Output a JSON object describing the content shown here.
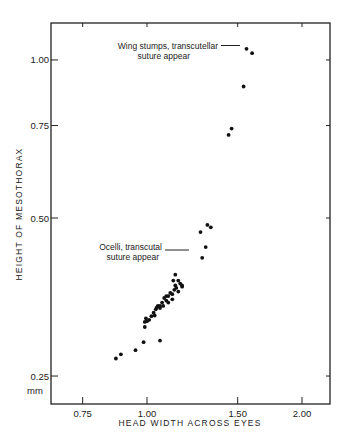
{
  "chart_data": {
    "type": "scatter",
    "title": "",
    "xlabel": "HEAD WIDTH ACROSS EYES",
    "ylabel": "HEIGHT OF MESOTHORAX",
    "x_scale": "log",
    "y_scale": "log",
    "xlim": [
      0.66,
      2.2
    ],
    "ylim": [
      0.235,
      1.15
    ],
    "x_ticks": [
      {
        "value": 0.75,
        "label": "0.75"
      },
      {
        "value": 1.0,
        "label": "1.00"
      },
      {
        "value": 1.5,
        "label": "1.50"
      },
      {
        "value": 2.0,
        "label": "2.00"
      }
    ],
    "y_ticks": [
      {
        "value": 0.25,
        "label": "0.25"
      },
      {
        "value": 0.5,
        "label": "0.50"
      },
      {
        "value": 0.75,
        "label": "0.75"
      },
      {
        "value": 1.0,
        "label": "1.00"
      }
    ],
    "y_unit_label": "mm",
    "grid": false,
    "legend": null,
    "annotations": [
      {
        "lines": [
          "Wing stumps, transcutellar",
          "suture appear"
        ],
        "points_to": [
          1.55,
          1.05
        ]
      },
      {
        "lines": [
          "Ocelli, transcutal",
          "suture appear"
        ],
        "points_to": [
          1.28,
          0.42
        ]
      }
    ],
    "series": [
      {
        "name": "specimens",
        "points": [
          [
            0.87,
            0.27
          ],
          [
            0.89,
            0.275
          ],
          [
            0.95,
            0.28
          ],
          [
            0.985,
            0.29
          ],
          [
            1.06,
            0.292
          ],
          [
            0.99,
            0.31
          ],
          [
            0.99,
            0.317
          ],
          [
            0.995,
            0.322
          ],
          [
            1.0,
            0.318
          ],
          [
            1.01,
            0.32
          ],
          [
            1.02,
            0.325
          ],
          [
            1.03,
            0.33
          ],
          [
            1.035,
            0.326
          ],
          [
            1.04,
            0.335
          ],
          [
            1.05,
            0.34
          ],
          [
            1.06,
            0.337
          ],
          [
            1.07,
            0.345
          ],
          [
            1.075,
            0.34
          ],
          [
            1.08,
            0.352
          ],
          [
            1.09,
            0.348
          ],
          [
            1.1,
            0.355
          ],
          [
            1.1,
            0.345
          ],
          [
            1.11,
            0.36
          ],
          [
            1.12,
            0.358
          ],
          [
            1.12,
            0.35
          ],
          [
            1.13,
            0.365
          ],
          [
            1.135,
            0.372
          ],
          [
            1.14,
            0.368
          ],
          [
            1.15,
            0.362
          ],
          [
            1.16,
            0.375
          ],
          [
            1.17,
            0.37
          ],
          [
            1.125,
            0.38
          ],
          [
            1.135,
            0.39
          ],
          [
            1.15,
            0.38
          ],
          [
            1.17,
            0.372
          ],
          [
            1.06,
            0.34
          ],
          [
            1.045,
            0.338
          ],
          [
            1.09,
            0.355
          ],
          [
            1.28,
            0.42
          ],
          [
            1.3,
            0.44
          ],
          [
            1.27,
            0.47
          ],
          [
            1.31,
            0.485
          ],
          [
            1.33,
            0.48
          ],
          [
            1.44,
            0.72
          ],
          [
            1.46,
            0.74
          ],
          [
            1.54,
            0.89
          ],
          [
            1.56,
            1.05
          ],
          [
            1.6,
            1.03
          ]
        ]
      }
    ]
  }
}
